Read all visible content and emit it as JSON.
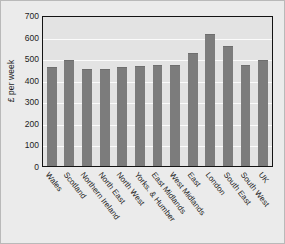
{
  "chart_data": {
    "type": "bar",
    "title": "",
    "subtitle": "",
    "xlabel": "",
    "ylabel": "£ per week",
    "ylim": [
      0,
      700
    ],
    "ytick_step": 100,
    "yticks": [
      700,
      600,
      500,
      400,
      300,
      200,
      100,
      0
    ],
    "grid": true,
    "legend": false,
    "legend_position": "none",
    "categories": [
      "Wales",
      "Scotland",
      "Northern Ireland",
      "North East",
      "North West",
      "Yorks. & Humber",
      "East Midlands",
      "West Midlands",
      "East",
      "London",
      "South East",
      "South West",
      "UK"
    ],
    "values": [
      460,
      490,
      452,
      452,
      460,
      463,
      468,
      469,
      525,
      610,
      555,
      470,
      493
    ],
    "bar_color": "#7c7c7c",
    "plot_background": "#e3e3e3",
    "figure_background": "#ebebeb",
    "gridline_color": "#fbfbfb",
    "axis_color": "#141414"
  }
}
